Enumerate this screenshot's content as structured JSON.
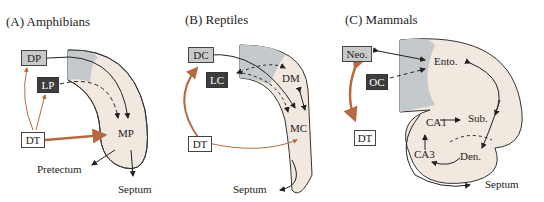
{
  "panels": [
    {
      "title": "(A) Amphibians",
      "boxes": {
        "gray": "DP",
        "dark": "LP",
        "white": "DT"
      },
      "labels": {
        "center": "MP",
        "out1": "Pretectum",
        "out2": "Septum"
      }
    },
    {
      "title": "(B) Reptiles",
      "boxes": {
        "gray": "DC",
        "dark": "LC",
        "white": "DT"
      },
      "labels": {
        "top": "DM",
        "center": "MC",
        "out": "Septum"
      }
    },
    {
      "title": "(C) Mammals",
      "boxes": {
        "gray": "Neo.",
        "dark": "OC",
        "white": "DT"
      },
      "labels": {
        "ento": "Ento.",
        "sub": "Sub.",
        "ca1": "CA1",
        "ca3": "CA3",
        "den": "Den.",
        "out": "Septum"
      }
    }
  ],
  "colors": {
    "tissue": "#f1e8e0",
    "gray_region": "#c4c9cb",
    "orange_arrow": "#b86a3e",
    "outline": "#333333"
  }
}
